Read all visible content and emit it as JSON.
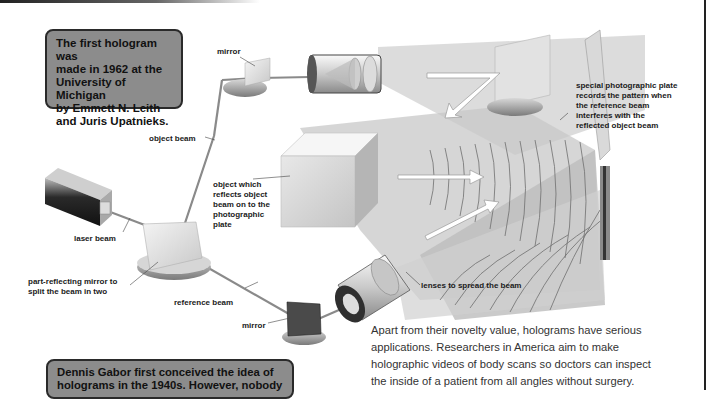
{
  "fact_boxes": {
    "first_hologram": "The first hologram was made in 1962 at the University of Michigan by Emmett N. Leith and Juris Upatnieks.",
    "first_hologram_lines": [
      "The first hologram was",
      "made in 1962 at the",
      "University of Michigan",
      "by Emmett N. Leith",
      "and Juris Upatnieks."
    ],
    "gabor_lines": [
      "Dennis Gabor first conceived the idea of",
      "holograms in the 1940s. However, nobody"
    ]
  },
  "labels": {
    "mirror_top": "mirror",
    "object_beam": "object beam",
    "laser_beam": "laser beam",
    "part_reflecting_mirror": [
      "part-reflecting mirror to",
      "split the beam in two"
    ],
    "reference_beam": "reference beam",
    "mirror_bottom": "mirror",
    "object": [
      "object which",
      "reflects object",
      "beam on to the",
      "photographic",
      "plate"
    ],
    "plate": [
      "special photographic plate",
      "records the pattern when",
      "the reference beam",
      "interferes with the",
      "reflected object beam"
    ],
    "lenses": "lenses to spread the beam"
  },
  "body_text_lines": [
    "Apart from their novelty value, holograms have serious",
    "applications. Researchers in America aim to make",
    "holographic videos of body scans so doctors can inspect",
    "the inside of a patient from all angles without surgery."
  ],
  "colors": {
    "box_fill": "#8c8c8c",
    "box_border": "#2a2a2a",
    "beam": "#7a7a7a",
    "beam_light": "#dcdcdc"
  }
}
